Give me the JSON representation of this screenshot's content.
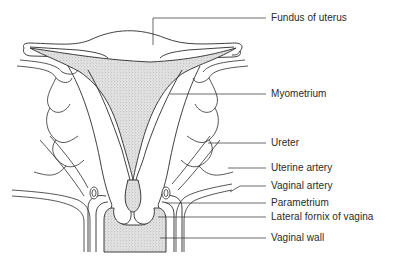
{
  "figure": {
    "labels": [
      {
        "id": "fundus",
        "text": "Fundus of uterus",
        "y": 12
      },
      {
        "id": "myometrium",
        "text": "Myometrium",
        "y": 86
      },
      {
        "id": "ureter",
        "text": "Ureter",
        "y": 135
      },
      {
        "id": "uterine-artery",
        "text": "Uterine artery",
        "y": 161
      },
      {
        "id": "vaginal-artery",
        "text": "Vaginal artery",
        "y": 180
      },
      {
        "id": "parametrium",
        "text": "Parametrium",
        "y": 195
      },
      {
        "id": "lateral-fornix",
        "text": "Lateral fornix of vagina",
        "y": 209
      },
      {
        "id": "vaginal-wall",
        "text": "Vaginal wall",
        "y": 231
      }
    ],
    "colors": {
      "line": "#2b2b2b",
      "stipple": "#bdbdbd",
      "background": "#ffffff"
    }
  }
}
